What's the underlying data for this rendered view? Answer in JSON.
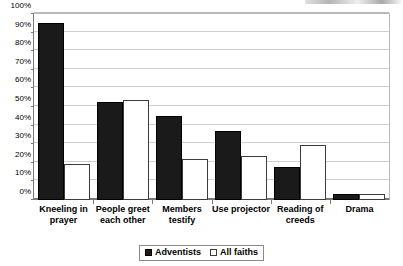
{
  "chart_data": {
    "type": "bar",
    "title": "",
    "subtitle": "",
    "xlabel": "",
    "ylabel": "",
    "ylim": [
      0,
      100
    ],
    "y_tick_labels": [
      "0%",
      "10%",
      "20%",
      "30%",
      "40%",
      "50%",
      "60%",
      "70%",
      "80%",
      "90%",
      "100%"
    ],
    "y_tick_values": [
      0,
      10,
      20,
      30,
      40,
      50,
      60,
      70,
      80,
      90,
      100
    ],
    "grid": "horizontal",
    "legend_position": "bottom-center",
    "categories": [
      "Kneeling in prayer",
      "People greet each other",
      "Members testify",
      "Use projector",
      "Reading of creeds",
      "Drama"
    ],
    "series": [
      {
        "name": "Adventists",
        "color": "#1a1a1a",
        "style": "filled",
        "values": [
          95,
          52.5,
          45,
          37,
          17.5,
          3
        ]
      },
      {
        "name": "All faiths",
        "color": "#ffffff",
        "style": "hollow",
        "values": [
          19.5,
          54,
          22,
          23.5,
          29.5,
          3
        ]
      }
    ]
  },
  "legend": {
    "items": [
      {
        "label": "Adventists",
        "swatch": "filled-square-icon"
      },
      {
        "label": "All faiths",
        "swatch": "hollow-square-icon"
      }
    ]
  }
}
